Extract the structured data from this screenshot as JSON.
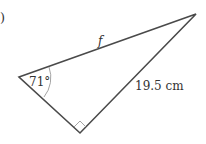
{
  "part_label": ")",
  "side_label_hyp": "f",
  "side_label_right": "19.5 cm",
  "angle_label": "71°",
  "colors": {
    "line": "#4a4a4a",
    "arc": "#9a9a9a",
    "text": "#333333"
  }
}
